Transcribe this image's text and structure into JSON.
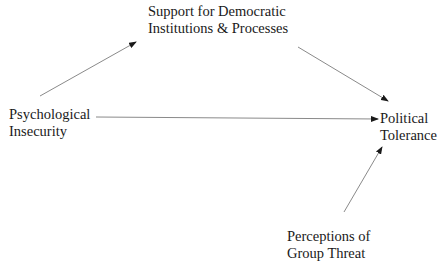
{
  "diagram": {
    "type": "path-model",
    "nodes": [
      {
        "id": "support",
        "lines": [
          "Support for Democratic",
          "Institutions & Processes"
        ]
      },
      {
        "id": "insecurity",
        "lines": [
          "Psychological",
          "Insecurity"
        ]
      },
      {
        "id": "tolerance",
        "lines": [
          "Political",
          "Tolerance"
        ]
      },
      {
        "id": "threat",
        "lines": [
          "Perceptions of",
          "Group Threat"
        ]
      }
    ],
    "edges": [
      {
        "from": "insecurity",
        "to": "support"
      },
      {
        "from": "support",
        "to": "tolerance"
      },
      {
        "from": "insecurity",
        "to": "tolerance"
      },
      {
        "from": "threat",
        "to": "tolerance"
      }
    ],
    "colors": {
      "line": "#8a8a8a",
      "arrowhead": "#1a1a1a",
      "text": "#1a1a1a",
      "background": "#ffffff"
    }
  }
}
